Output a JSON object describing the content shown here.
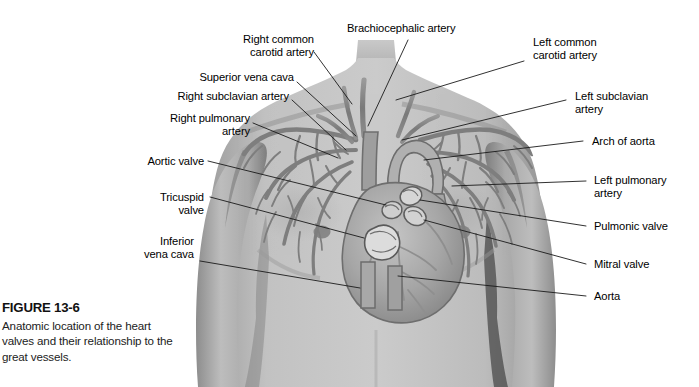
{
  "figure": {
    "title": "FIGURE 13-6",
    "caption": "Anatomic location of the heart valves and their relationship to the great vessels."
  },
  "labels_left": [
    {
      "key": "right_common_carotid",
      "text": "Right common\ncarotid artery"
    },
    {
      "key": "superior_vena_cava",
      "text": "Superior vena cava"
    },
    {
      "key": "right_subclavian_artery",
      "text": "Right subclavian artery"
    },
    {
      "key": "right_pulmonary_artery",
      "text": "Right pulmonary\nartery"
    },
    {
      "key": "aortic_valve",
      "text": "Aortic valve"
    },
    {
      "key": "tricuspid_valve",
      "text": "Tricuspid\nvalve"
    },
    {
      "key": "inferior_vena_cava",
      "text": "Inferior\nvena cava"
    }
  ],
  "labels_top": [
    {
      "key": "brachiocephalic_artery",
      "text": "Brachiocephalic artery"
    }
  ],
  "labels_right": [
    {
      "key": "left_common_carotid",
      "text": "Left common\ncarotid artery"
    },
    {
      "key": "left_subclavian_artery",
      "text": "Left subclavian\nartery"
    },
    {
      "key": "arch_of_aorta",
      "text": "Arch of aorta"
    },
    {
      "key": "left_pulmonary_artery",
      "text": "Left pulmonary\nartery"
    },
    {
      "key": "pulmonic_valve",
      "text": "Pulmonic valve"
    },
    {
      "key": "mitral_valve",
      "text": "Mitral valve"
    },
    {
      "key": "aorta",
      "text": "Aorta"
    }
  ],
  "colors": {
    "background": "#ffffff",
    "leader_line": "#1a1a1a",
    "label_text": "#000000",
    "skin_light": "#cfcfcf",
    "skin_mid": "#b2b2b2",
    "skin_dark": "#8f8f8f",
    "vessel": "#7d7d7d",
    "heart": "#a8a8a8"
  },
  "illustration": {
    "type": "anatomic-diagram",
    "subject": "male thorax with heart and great vessels",
    "view": "anterior"
  }
}
